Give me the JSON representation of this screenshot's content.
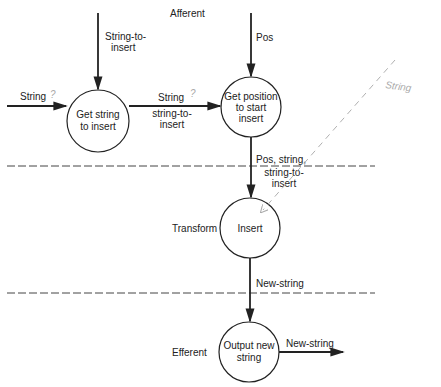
{
  "regions": {
    "afferent": "Afferent",
    "transform": "Transform",
    "efferent": "Efferent"
  },
  "processes": {
    "get_string": [
      "Get string",
      "to insert"
    ],
    "get_position": [
      "Get position",
      "to start",
      "insert"
    ],
    "insert": [
      "Insert"
    ],
    "output": [
      "Output new",
      "string"
    ]
  },
  "flows": {
    "string_to_insert_in": [
      "String-to-",
      "insert"
    ],
    "string_in": "String",
    "pos_in": "Pos",
    "string_mid": [
      "String",
      "string-to-",
      "insert"
    ],
    "pos_string": [
      "Pos, string,",
      "string-to-",
      "insert"
    ],
    "new_string_mid": "New-string",
    "new_string_out": "New-string"
  },
  "annotations": {
    "question_mark_1": "?",
    "question_mark_2": "?",
    "handwritten_string": "String"
  },
  "colors": {
    "ink": "#222222",
    "dashed": "#444444",
    "pencil": "#b0b0b0"
  }
}
